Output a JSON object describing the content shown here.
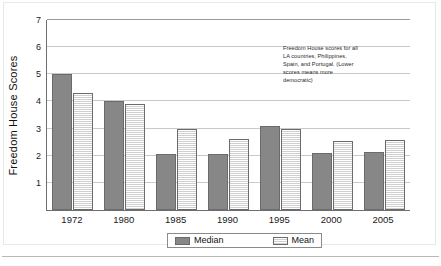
{
  "chart_data": {
    "type": "bar",
    "title": "",
    "xlabel": "",
    "ylabel": "Freedom House Scores",
    "categories": [
      "1972",
      "1980",
      "1985",
      "1990",
      "1995",
      "2000",
      "2005"
    ],
    "series": [
      {
        "name": "Median",
        "color": "#878787",
        "values": [
          5.0,
          4.0,
          2.05,
          2.07,
          3.1,
          2.1,
          2.15
        ]
      },
      {
        "name": "Mean",
        "color": "#dcdcdc",
        "values": [
          4.3,
          3.9,
          3.0,
          2.6,
          3.0,
          2.55,
          2.57
        ]
      }
    ],
    "ylim": [
      0,
      7
    ],
    "yticks": [
      "0",
      "1",
      "2",
      "3",
      "4",
      "5",
      "6",
      "7"
    ],
    "grid": true,
    "legend_position": "bottom",
    "annotations": [
      {
        "name": "scores-note",
        "lines": [
          "Freedom House scores for all",
          "LA countries, Philippines,",
          "Spain, and Portugal. (Lower",
          "scores means more",
          "democratic)"
        ]
      }
    ]
  },
  "legend": {
    "entries": [
      {
        "label": "Median"
      },
      {
        "label": "Mean"
      }
    ]
  }
}
